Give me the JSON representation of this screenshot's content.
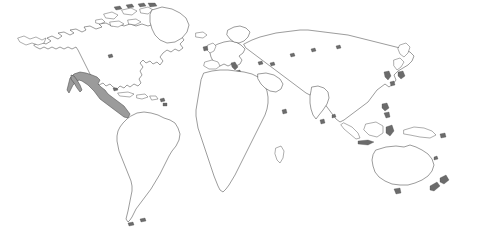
{
  "map": {
    "title": "World Map",
    "projection": "equirectangular",
    "background_color": "#ffffff",
    "land_fill_color": "#ffffff",
    "coastline_color": "#4a4a4a",
    "highlight_fill_color": "#9b9b9b",
    "highlighted_region_label": "Mexico and Central America",
    "legend_visible": false,
    "labels_visible": false,
    "graticule_visible": false,
    "regions": [
      {
        "name": "north-america",
        "label": "North America",
        "highlighted": false
      },
      {
        "name": "greenland",
        "label": "Greenland",
        "highlighted": false
      },
      {
        "name": "canadian-arctic",
        "label": "Canadian Arctic Archipelago",
        "highlighted": false
      },
      {
        "name": "mexico-central-america",
        "label": "Mexico and Central America",
        "highlighted": true
      },
      {
        "name": "caribbean",
        "label": "Caribbean Islands",
        "highlighted": false
      },
      {
        "name": "south-america",
        "label": "South America",
        "highlighted": false
      },
      {
        "name": "europe",
        "label": "Europe",
        "highlighted": false
      },
      {
        "name": "scandinavia",
        "label": "Scandinavia",
        "highlighted": false
      },
      {
        "name": "british-isles",
        "label": "British Isles",
        "highlighted": false
      },
      {
        "name": "africa",
        "label": "Africa",
        "highlighted": false
      },
      {
        "name": "madagascar",
        "label": "Madagascar",
        "highlighted": false
      },
      {
        "name": "asia",
        "label": "Asia",
        "highlighted": false
      },
      {
        "name": "india",
        "label": "Indian Subcontinent",
        "highlighted": false
      },
      {
        "name": "japan",
        "label": "Japan",
        "highlighted": false
      },
      {
        "name": "southeast-asia-islands",
        "label": "Indonesia and Philippines",
        "highlighted": false
      },
      {
        "name": "australia",
        "label": "Australia",
        "highlighted": false
      },
      {
        "name": "tasmania",
        "label": "Tasmania",
        "highlighted": false
      },
      {
        "name": "new-zealand",
        "label": "New Zealand",
        "highlighted": false
      },
      {
        "name": "sri-lanka",
        "label": "Sri Lanka",
        "highlighted": false
      },
      {
        "name": "iceland",
        "label": "Iceland",
        "highlighted": false
      }
    ]
  }
}
